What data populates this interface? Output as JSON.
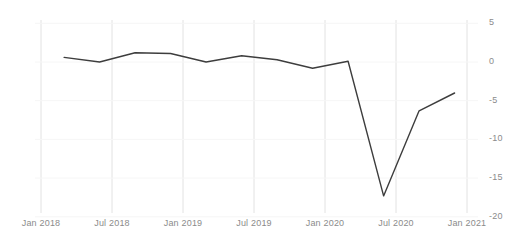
{
  "chart_data": {
    "type": "line",
    "title": "",
    "subtitle": "",
    "xlabel": "",
    "ylabel": "",
    "grid": "vertical",
    "legend": "none",
    "xlim": [
      "Jan 2018",
      "Jan 2021"
    ],
    "ylim": [
      -20,
      5
    ],
    "yticks": [
      5,
      0,
      -5,
      -10,
      -15,
      -20
    ],
    "ytick_labels": [
      "5",
      "0",
      "-5",
      "-10",
      "-15",
      "-20"
    ],
    "xticks": [
      "Jan 2018",
      "Jul 2018",
      "Jan 2019",
      "Jul 2019",
      "Jan 2020",
      "Jul 2020",
      "Jan 2021"
    ],
    "series": [
      {
        "name": "series-1",
        "color": "#3d3d3d",
        "x": [
          "Apr 2018",
          "Jul 2018",
          "Oct 2018",
          "Jan 2019",
          "Apr 2019",
          "Jul 2019",
          "Oct 2019",
          "Jan 2020",
          "Apr 2020",
          "Jul 2020",
          "Oct 2020",
          "Jan 2021"
        ],
        "values": [
          0.6,
          0.0,
          1.2,
          1.1,
          0.0,
          0.8,
          0.3,
          -0.8,
          0.1,
          -17.3,
          -6.3,
          -4.0
        ]
      }
    ]
  },
  "axis": {
    "y_title": "",
    "x_title": ""
  }
}
